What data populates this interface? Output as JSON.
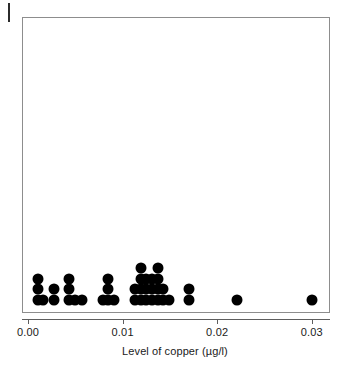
{
  "figure": {
    "kind": "dot-plot",
    "background_color": "#ffffff",
    "dot_color": "#000000",
    "frame_color": "#8d8d8d",
    "axis_color": "#5e5e5e"
  },
  "axis": {
    "title": "Level of copper (µg/l)",
    "tick_labels": [
      "0.00",
      "0.01",
      "0.02",
      "0.03"
    ],
    "tick_values": [
      0.0,
      0.01,
      0.02,
      0.03
    ]
  },
  "chart_data": {
    "type": "scatter",
    "plot_style": "dot-plot (stacked frequency dots)",
    "title": "",
    "subtitle": "",
    "xlabel": "Level of copper (µg/l)",
    "ylabel": "",
    "xlim": [
      0.0,
      0.0315
    ],
    "ylim": [
      0,
      26
    ],
    "x_ticks": [
      0.0,
      0.01,
      0.02,
      0.03
    ],
    "x_tick_labels": [
      "0.00",
      "0.01",
      "0.02",
      "0.03"
    ],
    "grid": false,
    "legend": null,
    "legend_position": "none",
    "y_axis_visible": false,
    "frame": "box",
    "dot_diameter_px": 11,
    "stacks": [
      {
        "x": 0.0011,
        "count": 3
      },
      {
        "x": 0.0016,
        "count": 1
      },
      {
        "x": 0.0028,
        "count": 2
      },
      {
        "x": 0.0043,
        "count": 3
      },
      {
        "x": 0.005,
        "count": 1
      },
      {
        "x": 0.0057,
        "count": 1
      },
      {
        "x": 0.0079,
        "count": 1
      },
      {
        "x": 0.0085,
        "count": 3
      },
      {
        "x": 0.0091,
        "count": 1
      },
      {
        "x": 0.0113,
        "count": 2
      },
      {
        "x": 0.0119,
        "count": 4
      },
      {
        "x": 0.0125,
        "count": 3
      },
      {
        "x": 0.0131,
        "count": 3
      },
      {
        "x": 0.0137,
        "count": 4
      },
      {
        "x": 0.0143,
        "count": 2
      },
      {
        "x": 0.0149,
        "count": 1
      },
      {
        "x": 0.017,
        "count": 2
      },
      {
        "x": 0.0221,
        "count": 1
      },
      {
        "x": 0.03,
        "count": 1
      }
    ],
    "values": [
      0.0011,
      0.0011,
      0.0011,
      0.0016,
      0.0028,
      0.0028,
      0.0043,
      0.0043,
      0.0043,
      0.005,
      0.0057,
      0.0079,
      0.0085,
      0.0085,
      0.0085,
      0.0091,
      0.0113,
      0.0113,
      0.0119,
      0.0119,
      0.0119,
      0.0119,
      0.0125,
      0.0125,
      0.0125,
      0.0131,
      0.0131,
      0.0131,
      0.0137,
      0.0137,
      0.0137,
      0.0137,
      0.0143,
      0.0143,
      0.0149,
      0.017,
      0.017,
      0.0221,
      0.03
    ],
    "n": 39
  }
}
